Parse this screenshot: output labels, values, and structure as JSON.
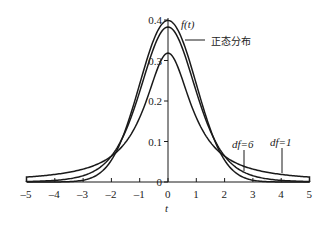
{
  "chart_data": {
    "type": "line",
    "title": "",
    "xlabel": "t",
    "ylabel": "f(t)",
    "xlim": [
      -5,
      5
    ],
    "ylim": [
      0,
      0.4
    ],
    "grid": false,
    "legend": "inline annotations",
    "x_ticks": [
      "-5",
      "-4",
      "-3",
      "-2",
      "-1",
      "0",
      "1",
      "2",
      "3",
      "4",
      "5"
    ],
    "y_ticks": [
      "0",
      "0.1",
      "0.2",
      "0.3",
      "0.4"
    ],
    "series": [
      {
        "name": "正态分布",
        "distribution": "normal",
        "peak": 0.399
      },
      {
        "name": "df=6",
        "distribution": "t",
        "df": 6,
        "peak": 0.383
      },
      {
        "name": "df=1",
        "distribution": "t",
        "df": 1,
        "peak": 0.318
      }
    ],
    "annotations": [
      {
        "text": "f(t)",
        "near": "top of y-axis"
      },
      {
        "text": "正态分布",
        "points_to": "normal curve"
      },
      {
        "text": "df=6",
        "points_to": "t curve df=6 at t≈2.7"
      },
      {
        "text": "df=1",
        "points_to": "t curve df=1 at t≈4"
      }
    ]
  },
  "labels": {
    "y_axis_title": "f(t)",
    "x_axis_title": "t",
    "normal": "正态分布",
    "df6": "df=6",
    "df1": "df=1"
  }
}
